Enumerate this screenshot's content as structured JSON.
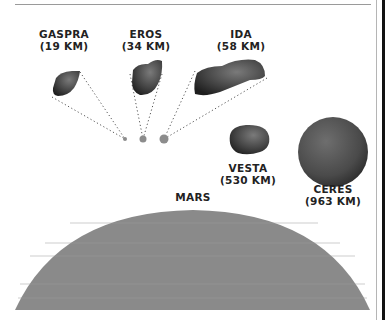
{
  "bodies": [
    {
      "name": "GASPRA",
      "size": "(19 KM)"
    },
    {
      "name": "EROS",
      "size": "(34 KM)"
    },
    {
      "name": "IDA",
      "size": "(58 KM)"
    },
    {
      "name": "VESTA",
      "size": "(530 KM)"
    },
    {
      "name": "CERES",
      "size": "(963 KM)"
    },
    {
      "name": "MARS",
      "size": ""
    }
  ],
  "colors": {
    "asteroid_dark": "#2a2a2a",
    "asteroid_mid": "#5a5a5a",
    "mars_fill": "#8a8a8a",
    "dot_fill": "#8c8c8c",
    "text": "#222222"
  }
}
